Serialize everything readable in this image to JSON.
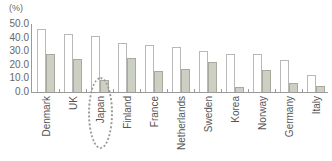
{
  "chart_data": {
    "type": "bar",
    "title": "",
    "unit_label": "(%)",
    "xlabel": "",
    "ylabel": "(%)",
    "ylim": [
      0,
      50
    ],
    "yticks": [
      "50.0",
      "40.0",
      "30.0",
      "20.0",
      "10.0",
      "0.0"
    ],
    "grid": false,
    "legend": null,
    "categories": [
      "Denmark",
      "UK",
      "Japan",
      "Finland",
      "France",
      "Netherlands",
      "Sweden",
      "Korea",
      "Norway",
      "Germany",
      "Italy"
    ],
    "series": [
      {
        "name": "Series 1 (white)",
        "color": "#ffffff",
        "values": [
          46.5,
          42.5,
          41.0,
          36.0,
          34.5,
          33.0,
          30.0,
          28.0,
          28.0,
          23.5,
          12.5
        ]
      },
      {
        "name": "Series 2 (grey)",
        "color": "#ccd0c2",
        "values": [
          28.0,
          24.0,
          9.0,
          25.0,
          15.5,
          17.0,
          22.0,
          3.5,
          16.0,
          6.5,
          4.5
        ]
      }
    ],
    "annotations": [
      {
        "type": "dotted-ellipse",
        "target": "Japan"
      }
    ]
  }
}
